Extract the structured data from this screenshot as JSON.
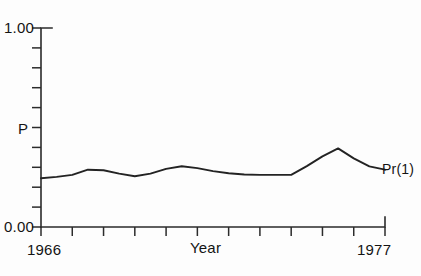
{
  "chart_data": {
    "type": "line",
    "title": "",
    "xlabel": "Year",
    "ylabel": "P",
    "xlim": [
      1966,
      1977
    ],
    "ylim": [
      0.0,
      1.0
    ],
    "grid": false,
    "legend_position": "right-of-line-end",
    "y_tick_labels": [
      "0.00",
      "1.00"
    ],
    "y_tick_values": [
      0.0,
      0.1,
      0.2,
      0.3,
      0.4,
      0.5,
      0.6,
      0.7,
      0.8,
      0.9,
      1.0
    ],
    "x_tick_labels": [
      "1966",
      "1977"
    ],
    "x_tick_values": [
      1966,
      1967,
      1968,
      1969,
      1970,
      1971,
      1972,
      1973,
      1974,
      1975,
      1976,
      1977
    ],
    "x": [
      1966,
      1966.5,
      1967,
      1967.5,
      1968,
      1968.5,
      1969,
      1969.5,
      1970,
      1970.5,
      1971,
      1971.5,
      1972,
      1972.5,
      1973,
      1973.5,
      1974,
      1974.5,
      1975,
      1975.5,
      1976,
      1976.5,
      1977
    ],
    "series": [
      {
        "name": "Pr(1)",
        "label": "Pr(1)",
        "color": "#232323",
        "values": [
          0.245,
          0.252,
          0.262,
          0.288,
          0.285,
          0.268,
          0.255,
          0.268,
          0.292,
          0.305,
          0.296,
          0.281,
          0.27,
          0.264,
          0.262,
          0.262,
          0.262,
          0.306,
          0.355,
          0.395,
          0.345,
          0.305,
          0.288
        ]
      }
    ],
    "annotations": [
      "Pr(1)"
    ]
  },
  "axes": {
    "y_max_label": "1.00",
    "y_min_label": "0.00",
    "y_axis_title": "P",
    "x_min_label": "1966",
    "x_max_label": "1977",
    "x_axis_title": "Year"
  },
  "series_label": "Pr(1)"
}
